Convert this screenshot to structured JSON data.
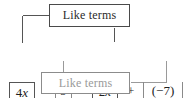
{
  "diagram": {
    "title_alt": "Like terms grouping diagram",
    "expression": {
      "terms": [
        {
          "id": "term-4x",
          "text": "4x",
          "coefficient": "4",
          "variable": "x",
          "bracket": "top",
          "group": "like-terms-variable"
        },
        {
          "id": "term-9",
          "text": "9",
          "coefficient": "9",
          "variable": "",
          "bracket": "bottom",
          "group": "like-terms-constant"
        },
        {
          "id": "term-2x",
          "text": "2x",
          "coefficient": "2",
          "variable": "x",
          "bracket": "top",
          "group": "like-terms-variable"
        },
        {
          "id": "term-neg7",
          "text": "(−7)",
          "coefficient": "−7",
          "variable": "",
          "bracket": "bottom",
          "group": "like-terms-constant"
        }
      ],
      "operators": [
        "+",
        "+",
        "+"
      ],
      "full_text": "4x + 9 + 2x + (−7)"
    },
    "labels": {
      "top_box": "Like terms",
      "bottom_box": "Like terms"
    },
    "colors": {
      "background": "#ffffff",
      "top_box_border": "#4a4a4a",
      "top_box_text": "#2b2b2b",
      "bottom_box_border": "#8c8c8c",
      "bottom_box_text": "#9a9a9a",
      "expression_text": "#1e1e1e",
      "top_connector": "#555555",
      "bottom_connector": "#9a9a9a"
    }
  }
}
